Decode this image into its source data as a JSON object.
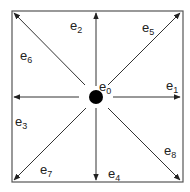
{
  "diagram": {
    "center_label": {
      "base": "e",
      "sub": "0"
    },
    "vectors": [
      {
        "name": "e1",
        "base": "e",
        "sub": "1",
        "direction": "east"
      },
      {
        "name": "e2",
        "base": "e",
        "sub": "2",
        "direction": "north"
      },
      {
        "name": "e3",
        "base": "e",
        "sub": "3",
        "direction": "west"
      },
      {
        "name": "e4",
        "base": "e",
        "sub": "4",
        "direction": "south"
      },
      {
        "name": "e5",
        "base": "e",
        "sub": "5",
        "direction": "north-east"
      },
      {
        "name": "e6",
        "base": "e",
        "sub": "6",
        "direction": "north-west"
      },
      {
        "name": "e7",
        "base": "e",
        "sub": "7",
        "direction": "south-west"
      },
      {
        "name": "e8",
        "base": "e",
        "sub": "8",
        "direction": "south-east"
      }
    ],
    "colors": {
      "line": "#333333",
      "dot": "#000000"
    }
  }
}
